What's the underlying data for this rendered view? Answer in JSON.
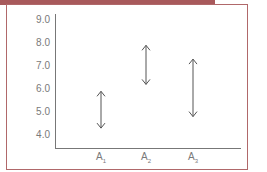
{
  "frame": {
    "border_color": "#b0686a",
    "band_color": "#a8595b"
  },
  "chart_data": {
    "type": "range",
    "title": "",
    "xlabel": "",
    "ylabel": "",
    "categories": [
      "A1",
      "A2",
      "A3"
    ],
    "category_labels": [
      {
        "base": "A",
        "sub": "1"
      },
      {
        "base": "A",
        "sub": "2"
      },
      {
        "base": "A",
        "sub": "3"
      }
    ],
    "series": [
      {
        "name": "range",
        "low": [
          4.3,
          6.2,
          4.8
        ],
        "high": [
          5.9,
          7.9,
          7.3
        ]
      }
    ],
    "yticks": [
      "9.0",
      "8.0",
      "7.0",
      "6.0",
      "5.0",
      "4.0"
    ],
    "ylim": [
      3.6,
      9.2
    ],
    "grid": false,
    "legend": null,
    "marker": "double-headed-arrow"
  }
}
